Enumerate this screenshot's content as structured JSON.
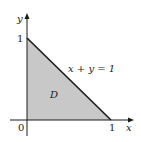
{
  "diagram": {
    "type": "region-plot",
    "axes": {
      "x_label": "x",
      "y_label": "y",
      "origin_label": "0",
      "x_tick_label": "1",
      "y_tick_label": "1"
    },
    "region": {
      "label": "D",
      "vertices": [
        [
          0,
          0
        ],
        [
          1,
          0
        ],
        [
          0,
          1
        ]
      ],
      "fill": "#c8c8c8"
    },
    "boundary": {
      "equation": "x + y = 1"
    },
    "colors": {
      "line": "#1a1a1a",
      "fill": "#c8c8c8",
      "background": "#ffffff"
    }
  }
}
